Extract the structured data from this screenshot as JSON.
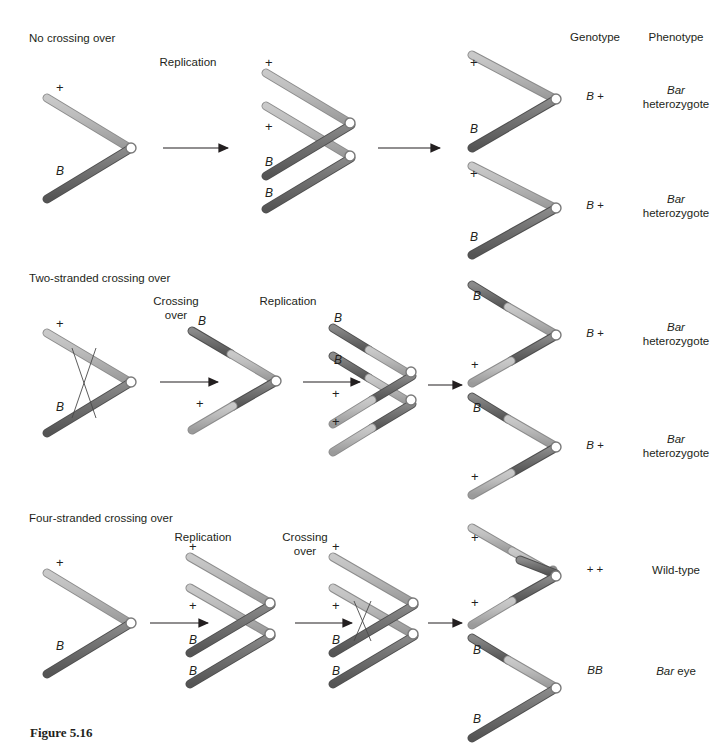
{
  "figure": {
    "caption": "Figure 5.16"
  },
  "columns": {
    "genotype_header": "Genotype",
    "phenotype_header": "Phenotype"
  },
  "rows": [
    {
      "title": "No crossing over",
      "steps": [
        {
          "label": "Replication"
        }
      ],
      "stage_labels": {
        "start": [
          "+",
          "B"
        ],
        "replicated": [
          "+",
          "+",
          "B",
          "B"
        ]
      },
      "products": [
        {
          "labels": [
            "+",
            "B"
          ],
          "genotype": "B +",
          "phenotype_line1": "Bar",
          "phenotype_line2": "heterozygote"
        },
        {
          "labels": [
            "+",
            "B"
          ],
          "genotype": "B +",
          "phenotype_line1": "Bar",
          "phenotype_line2": "heterozygote"
        }
      ]
    },
    {
      "title": "Two-stranded crossing over",
      "steps": [
        {
          "label_line1": "Crossing",
          "label_line2": "over"
        },
        {
          "label_line1": "Replication",
          "label_line2": ""
        }
      ],
      "stage_labels": {
        "start": [
          "+",
          "B"
        ],
        "after_crossover": [
          "B",
          "+"
        ],
        "replicated": [
          "B",
          "B",
          "+",
          "+"
        ]
      },
      "products": [
        {
          "labels": [
            "B",
            "+"
          ],
          "genotype": "B +",
          "phenotype_line1": "Bar",
          "phenotype_line2": "heterozygote"
        },
        {
          "labels": [
            "B",
            "+"
          ],
          "genotype": "B +",
          "phenotype_line1": "Bar",
          "phenotype_line2": "heterozygote"
        }
      ]
    },
    {
      "title": "Four-stranded crossing over",
      "steps": [
        {
          "label_line1": "Replication",
          "label_line2": ""
        },
        {
          "label_line1": "Crossing",
          "label_line2": "over"
        }
      ],
      "stage_labels": {
        "start": [
          "+",
          "B"
        ],
        "replicated": [
          "+",
          "+",
          "B",
          "B"
        ],
        "after_crossover": [
          "+",
          "+",
          "B",
          "B"
        ]
      },
      "products": [
        {
          "labels": [
            "+",
            "+"
          ],
          "genotype": "+ +",
          "phenotype_line1": "Wild-type",
          "phenotype_line2": ""
        },
        {
          "labels": [
            "B",
            "B"
          ],
          "genotype": "BB",
          "phenotype_line1": "Bar",
          "phenotype_line2": "eye"
        }
      ]
    }
  ],
  "colors": {
    "light_strand": "#b4b4b4",
    "light_strand_edge": "#8c8c8c",
    "dark_strand": "#6e6e6e",
    "dark_strand_edge": "#4f4f4f",
    "centromere_fill": "#ffffff",
    "centromere_edge": "#7a7a7a",
    "arrow": "#231f20",
    "text": "#231f20"
  }
}
